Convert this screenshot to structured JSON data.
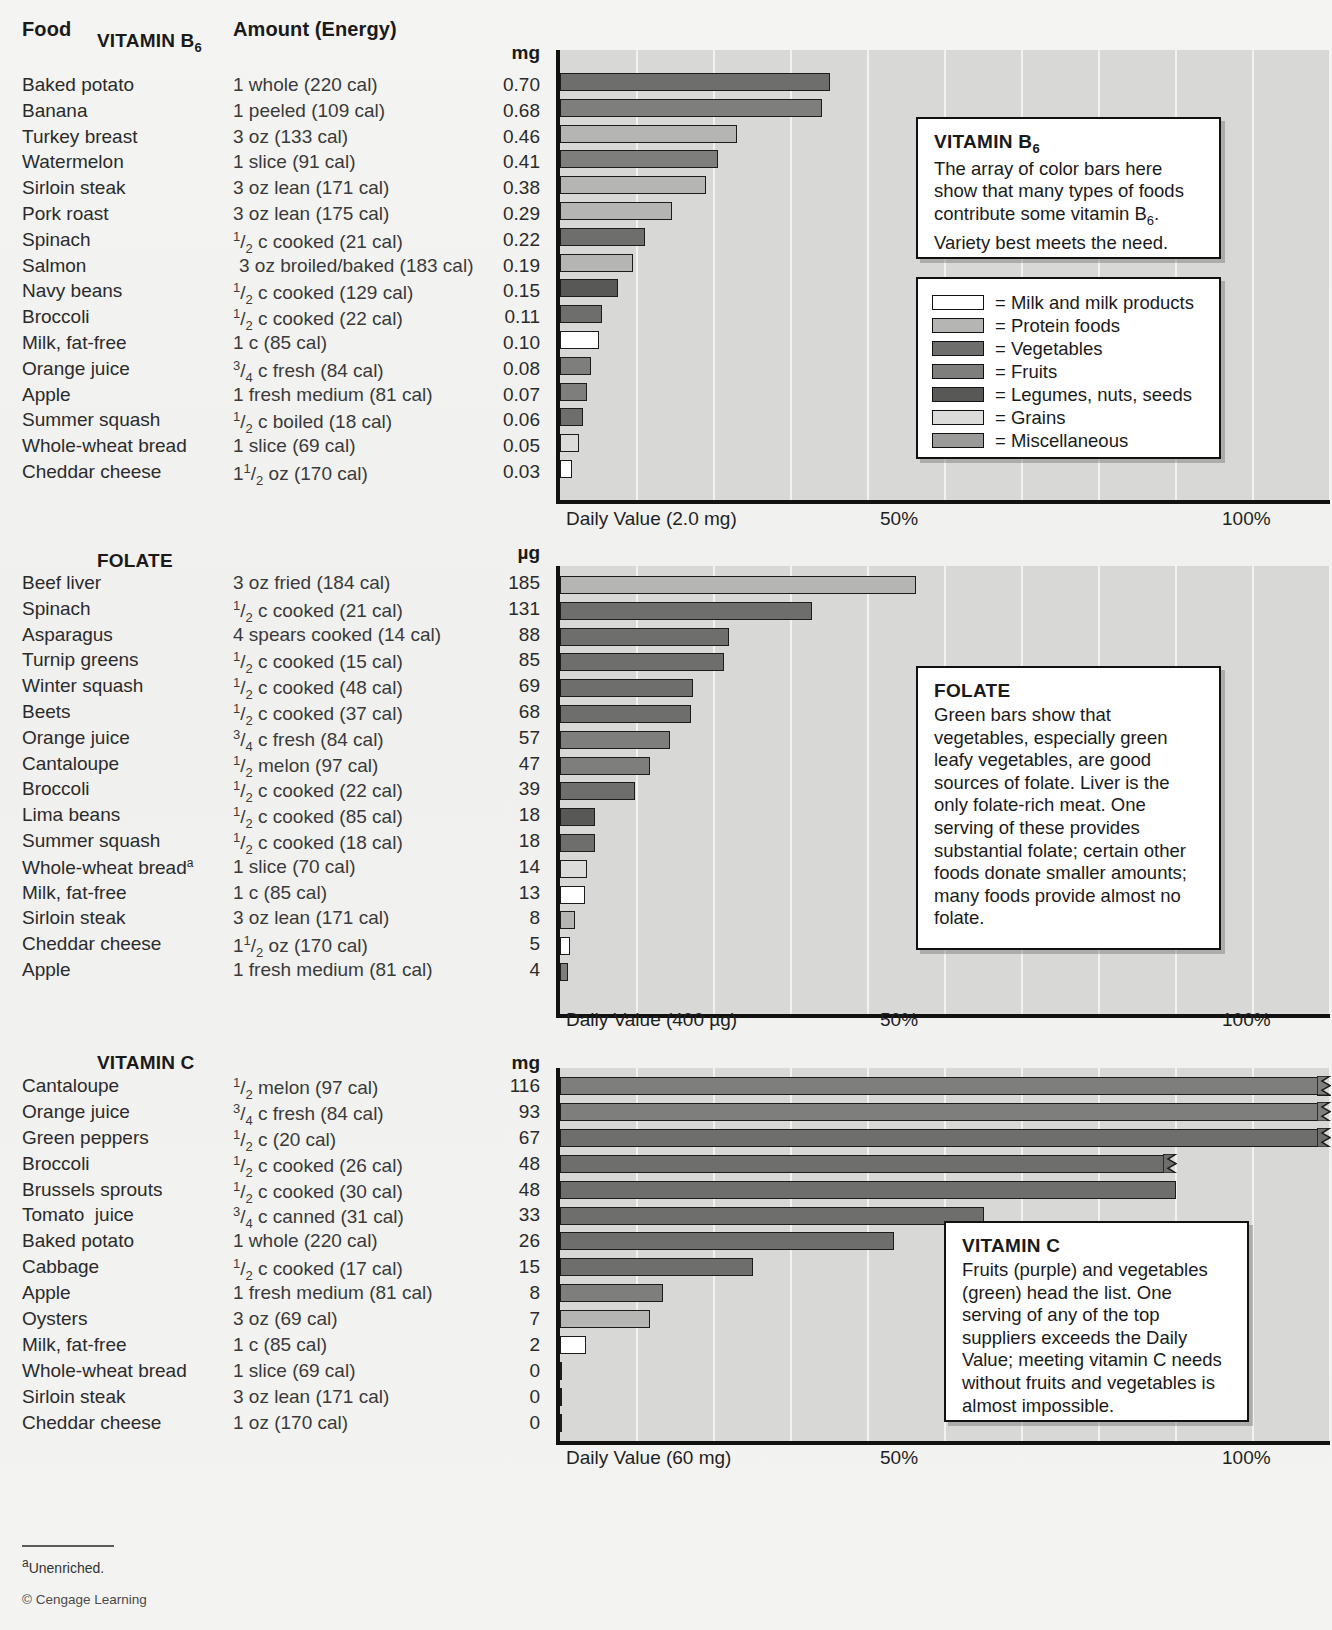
{
  "headers": {
    "food": "Food",
    "amount": "Amount (Energy)"
  },
  "footnote": {
    "marker": "a",
    "text": "Unenriched."
  },
  "copyright": "© Cengage Learning",
  "legend": {
    "items": [
      {
        "label": "= Milk and milk products",
        "color": "#ffffff"
      },
      {
        "label": "= Protein foods",
        "color": "#b5b5b3"
      },
      {
        "label": "= Vegetables",
        "color": "#6e6e6c"
      },
      {
        "label": "= Fruits",
        "color": "#7e7e7c"
      },
      {
        "label": "= Legumes, nuts, seeds",
        "color": "#585856"
      },
      {
        "label": "= Grains",
        "color": "#dcdcda"
      },
      {
        "label": "= Miscellaneous",
        "color": "#9a9a98"
      }
    ]
  },
  "callouts": {
    "b6": {
      "title": "VITAMIN B6",
      "title_main": "VITAMIN B",
      "title_sub": "6",
      "body": "The array of color bars here show that many types of foods contribute some vitamin B6. Variety best meets the need.",
      "line1": "The array of color bars here",
      "line2": "show that many types of foods",
      "line3a": "contribute some vitamin B",
      "line3b": "6",
      "line3c": ".",
      "line4": "Variety best meets the need."
    },
    "folate": {
      "title": "FOLATE",
      "body": "Green bars show that vegetables, especially green leafy vegetables, are good sources of folate. Liver is the only folate-rich meat. One serving of these provides substantial folate; certain other foods donate smaller amounts; many foods provide almost no folate."
    },
    "vitc": {
      "title": "VITAMIN C",
      "body": "Fruits (purple) and vegetables (green) head the list. One serving of any of the top suppliers exceeds the Daily Value; meeting vitamin C needs without fruits and vegetables is almost impossible."
    }
  },
  "chart_data": [
    {
      "type": "bar",
      "title": "VITAMIN B6",
      "title_main": "VITAMIN B",
      "title_sub": "6",
      "unit": "mg",
      "daily_value_label": "Daily Value (2.0 mg)",
      "tick_50": "50%",
      "tick_100": "100%",
      "daily_value": 2.0,
      "xlabel": "Percent of Daily Value",
      "ylabel": "",
      "xlim": [
        0,
        100
      ],
      "grid": true,
      "categories": [
        "Baked potato",
        "Banana",
        "Turkey breast",
        "Watermelon",
        "Sirloin steak",
        "Pork roast",
        "Spinach",
        "Salmon",
        "Navy beans",
        "Broccoli",
        "Milk, fat-free",
        "Orange juice",
        "Apple",
        "Summer squash",
        "Whole-wheat bread",
        "Cheddar cheese"
      ],
      "values": [
        0.7,
        0.68,
        0.46,
        0.41,
        0.38,
        0.29,
        0.22,
        0.19,
        0.15,
        0.11,
        0.1,
        0.08,
        0.07,
        0.06,
        0.05,
        0.03
      ],
      "value_labels": [
        "0.70",
        "0.68",
        "0.46",
        "0.41",
        "0.38",
        "0.29",
        "0.22",
        "0.19",
        "0.15",
        "0.11",
        "0.10",
        "0.08",
        "0.07",
        "0.06",
        "0.05",
        "0.03"
      ],
      "amounts": [
        "1 whole (220 cal)",
        "1 peeled (109 cal)",
        "3 oz (133 cal)",
        "1 slice (91 cal)",
        "3 oz lean (171 cal)",
        "3 oz lean (175 cal)",
        "1/2 c cooked (21 cal)",
        "3 oz broiled/baked (183 cal)",
        "1/2 c cooked (129 cal)",
        "1/2 c cooked (22 cal)",
        "1 c (85 cal)",
        "3/4 c fresh (84 cal)",
        "1 fresh medium (81 cal)",
        "1/2 c boiled (18 cal)",
        "1 slice (69 cal)",
        "11/2 oz (170 cal)"
      ],
      "groups": [
        "Vegetables",
        "Fruits",
        "Protein foods",
        "Fruits",
        "Protein foods",
        "Protein foods",
        "Vegetables",
        "Protein foods",
        "Legumes, nuts, seeds",
        "Vegetables",
        "Milk and milk products",
        "Fruits",
        "Fruits",
        "Vegetables",
        "Grains",
        "Milk and milk products"
      ]
    },
    {
      "type": "bar",
      "title": "FOLATE",
      "unit": "µg",
      "daily_value_label": "Daily Value (400 µg)",
      "tick_50": "50%",
      "tick_100": "100%",
      "daily_value": 400,
      "xlabel": "Percent of Daily Value",
      "ylabel": "",
      "xlim": [
        0,
        100
      ],
      "grid": true,
      "categories": [
        "Beef liver",
        "Spinach",
        "Asparagus",
        "Turnip greens",
        "Winter squash",
        "Beets",
        "Orange juice",
        "Cantaloupe",
        "Broccoli",
        "Lima beans",
        "Summer squash",
        "Whole-wheat bread",
        "Milk, fat-free",
        "Sirloin steak",
        "Cheddar cheese",
        "Apple"
      ],
      "values": [
        185,
        131,
        88,
        85,
        69,
        68,
        57,
        47,
        39,
        18,
        18,
        14,
        13,
        8,
        5,
        4
      ],
      "value_labels": [
        "185",
        "131",
        "88",
        "85",
        "69",
        "68",
        "57",
        "47",
        "39",
        "18",
        "18",
        "14",
        "13",
        "8",
        "5",
        "4"
      ],
      "amounts": [
        "3 oz fried (184 cal)",
        "1/2 c cooked (21 cal)",
        "4 spears cooked (14 cal)",
        "1/2 c cooked (15 cal)",
        "1/2 c cooked (48 cal)",
        "1/2 c cooked (37 cal)",
        "3/4 c fresh (84 cal)",
        "1/2 melon (97 cal)",
        "1/2 c cooked (22 cal)",
        "1/2 c cooked (85 cal)",
        "1/2 c cooked (18 cal)",
        "1 slice (70 cal)",
        "1 c (85 cal)",
        "3 oz lean (171 cal)",
        "11/2 oz (170 cal)",
        "1 fresh medium (81 cal)"
      ],
      "groups": [
        "Protein foods",
        "Vegetables",
        "Vegetables",
        "Vegetables",
        "Vegetables",
        "Vegetables",
        "Fruits",
        "Fruits",
        "Vegetables",
        "Legumes, nuts, seeds",
        "Vegetables",
        "Grains",
        "Milk and milk products",
        "Protein foods",
        "Milk and milk products",
        "Fruits"
      ],
      "footnote_rows": [
        "Whole-wheat bread"
      ]
    },
    {
      "type": "bar",
      "title": "VITAMIN C",
      "unit": "mg",
      "daily_value_label": "Daily Value (60 mg)",
      "tick_50": "50%",
      "tick_100": "100%",
      "daily_value": 60,
      "xlabel": "Percent of Daily Value",
      "ylabel": "",
      "xlim": [
        0,
        100
      ],
      "grid": true,
      "categories": [
        "Cantaloupe",
        "Orange juice",
        "Green peppers",
        "Broccoli",
        "Brussels sprouts",
        "Tomato  juice",
        "Baked potato",
        "Cabbage",
        "Apple",
        "Oysters",
        "Milk, fat-free",
        "Whole-wheat bread",
        "Sirloin steak",
        "Cheddar cheese"
      ],
      "values": [
        116,
        93,
        67,
        48,
        48,
        33,
        26,
        15,
        8,
        7,
        2,
        0,
        0,
        0
      ],
      "value_labels": [
        "116",
        "93",
        "67",
        "48",
        "48",
        "33",
        "26",
        "15",
        "8",
        "7",
        "2",
        "0",
        "0",
        "0"
      ],
      "amounts": [
        "1/2 melon (97 cal)",
        "3/4 c fresh (84 cal)",
        "1/2 c (20 cal)",
        "1/2 c cooked (26 cal)",
        "1/2 c cooked (30 cal)",
        "3/4 c canned (31 cal)",
        "1 whole (220 cal)",
        "1/2 c cooked (17 cal)",
        "1 fresh medium (81 cal)",
        "3 oz (69 cal)",
        "1 c (85 cal)",
        "1 slice (69 cal)",
        "3 oz lean (171 cal)",
        "1 oz (170 cal)"
      ],
      "groups": [
        "Fruits",
        "Fruits",
        "Vegetables",
        "Vegetables",
        "Vegetables",
        "Vegetables",
        "Vegetables",
        "Vegetables",
        "Fruits",
        "Protein foods",
        "Milk and milk products",
        "Grains",
        "Protein foods",
        "Milk and milk products"
      ],
      "overflow_indices": [
        0,
        1,
        2,
        3
      ]
    }
  ]
}
